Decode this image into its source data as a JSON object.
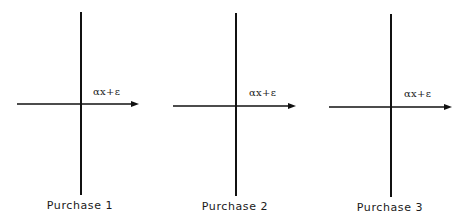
{
  "panels": [
    {
      "caption": "Purchase 1",
      "axis_label": "αx+ε",
      "vertical_axis": {
        "x": 81,
        "y1": 12,
        "y2": 195
      },
      "horizontal_axis": {
        "y": 104,
        "x1": 17,
        "x2": 139
      },
      "label_pos": {
        "x": 93,
        "y": 86
      },
      "caption_pos": {
        "x": 80,
        "y": 199
      }
    },
    {
      "caption": "Purchase 2",
      "axis_label": "αx+ε",
      "vertical_axis": {
        "x": 236,
        "y1": 13,
        "y2": 196
      },
      "horizontal_axis": {
        "y": 106,
        "x1": 173,
        "x2": 296
      },
      "label_pos": {
        "x": 249,
        "y": 87
      },
      "caption_pos": {
        "x": 235,
        "y": 200
      }
    },
    {
      "caption": "Purchase 3",
      "axis_label": "αx+ε",
      "vertical_axis": {
        "x": 391,
        "y1": 14,
        "y2": 197
      },
      "horizontal_axis": {
        "y": 107,
        "x1": 329,
        "x2": 452
      },
      "label_pos": {
        "x": 404,
        "y": 88
      },
      "caption_pos": {
        "x": 390,
        "y": 201
      }
    }
  ],
  "colors": {
    "line": "#111111",
    "background": "#ffffff"
  }
}
